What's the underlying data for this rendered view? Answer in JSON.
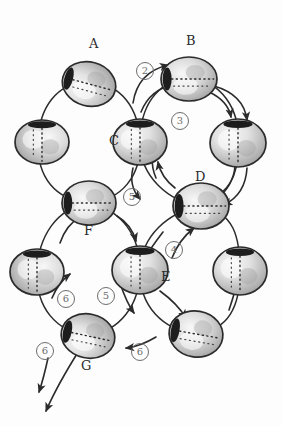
{
  "figure": {
    "background_color": "#fdfdfd",
    "ink_color": "#2b2b2b",
    "step_marker_color": "#6d6d6d",
    "torus_fill_light": "#efefef",
    "torus_fill_mid": "#c9c9c9",
    "torus_fill_dark": "#8f8f8f",
    "hole_color": "#1d1d1d"
  },
  "node_labels": [
    {
      "id": "A",
      "text": "A",
      "x": 93,
      "y": 44,
      "node_x": 89,
      "node_y": 84
    },
    {
      "id": "B",
      "text": "B",
      "x": 190,
      "y": 41,
      "node_x": 189,
      "node_y": 79
    },
    {
      "id": "C",
      "text": "C",
      "x": 113,
      "y": 141,
      "node_x": 140,
      "node_y": 142
    },
    {
      "id": "D",
      "text": "D",
      "x": 199,
      "y": 177,
      "node_x": 201,
      "node_y": 206
    },
    {
      "id": "E",
      "text": "E",
      "x": 165,
      "y": 277,
      "node_x": 140,
      "node_y": 270
    },
    {
      "id": "F",
      "text": "F",
      "x": 88,
      "y": 231,
      "node_x": 89,
      "node_y": 203
    },
    {
      "id": "G",
      "text": "G",
      "x": 85,
      "y": 366,
      "node_x": 88,
      "node_y": 336
    }
  ],
  "unlabeled_nodes": [
    {
      "id": "u1",
      "x": 42,
      "y": 142
    },
    {
      "id": "u2",
      "x": 238,
      "y": 143
    },
    {
      "id": "u3",
      "x": 37,
      "y": 272
    },
    {
      "id": "u4",
      "x": 240,
      "y": 271
    },
    {
      "id": "u5",
      "x": 196,
      "y": 334
    }
  ],
  "step_markers": [
    {
      "id": "s2",
      "text": "2",
      "x": 144,
      "y": 70
    },
    {
      "id": "s3",
      "text": "3",
      "x": 179,
      "y": 120
    },
    {
      "id": "s5a",
      "text": "5",
      "x": 131,
      "y": 196
    },
    {
      "id": "s4",
      "text": "4",
      "x": 173,
      "y": 249
    },
    {
      "id": "s6a",
      "text": "6",
      "x": 65,
      "y": 298
    },
    {
      "id": "s5b",
      "text": "5",
      "x": 105,
      "y": 295
    },
    {
      "id": "s6b",
      "text": "6",
      "x": 139,
      "y": 351
    },
    {
      "id": "s6c",
      "text": "6",
      "x": 44,
      "y": 350
    }
  ],
  "rings": [
    {
      "id": "ring-upper-left",
      "cx": 89,
      "cy": 143,
      "rx": 52,
      "ry": 62,
      "members": [
        "A",
        "u1",
        "F",
        "C"
      ]
    },
    {
      "id": "ring-upper-right",
      "cx": 190,
      "cy": 143,
      "rx": 52,
      "ry": 66,
      "members": [
        "B",
        "u2",
        "D",
        "C"
      ]
    },
    {
      "id": "ring-lower-left",
      "cx": 88,
      "cy": 272,
      "rx": 52,
      "ry": 65,
      "members": [
        "F",
        "u3",
        "G",
        "E"
      ]
    },
    {
      "id": "ring-lower-right",
      "cx": 190,
      "cy": 271,
      "rx": 52,
      "ry": 64,
      "members": [
        "D",
        "u4",
        "u5",
        "E"
      ]
    }
  ],
  "outflow_arrows": [
    {
      "id": "out-left",
      "from": "s6c",
      "x1": 48,
      "y1": 360,
      "x2": 38,
      "y2": 392
    },
    {
      "id": "out-right",
      "from": "G",
      "x1": 80,
      "y1": 350,
      "x2": 46,
      "y2": 412
    }
  ]
}
